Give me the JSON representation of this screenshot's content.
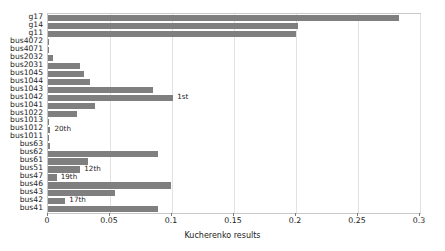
{
  "chart_data": {
    "type": "bar",
    "orientation": "horizontal",
    "title": "",
    "xlabel": "Kucherenko results",
    "ylabel": "",
    "xlim": [
      0,
      0.3
    ],
    "ylim": null,
    "grid": true,
    "legend": null,
    "tick_labels": [
      "0",
      "0.05",
      "0.1",
      "0.15",
      "0.2",
      "0.25",
      "0.3"
    ],
    "ticks": [
      0,
      0.05,
      0.1,
      0.15,
      0.2,
      0.25,
      0.3
    ],
    "bar_color": "#7f7f7f",
    "categories": [
      "g17",
      "g14",
      "g11",
      "bus4072",
      "bus4071",
      "bus2032",
      "bus2031",
      "bus1045",
      "bus1044",
      "bus1043",
      "bus1042",
      "bus1041",
      "bus1022",
      "bus1013",
      "bus1012",
      "bus1011",
      "bus63",
      "bus62",
      "bus61",
      "bus51",
      "bus47",
      "bus46",
      "bus43",
      "bus42",
      "bus41"
    ],
    "values": [
      0.283,
      0.202,
      0.2,
      0.001,
      0.001,
      0.004,
      0.026,
      0.029,
      0.034,
      0.085,
      0.101,
      0.038,
      0.023,
      0.001,
      0.002,
      0.001,
      0.002,
      0.089,
      0.032,
      0.026,
      0.007,
      0.099,
      0.054,
      0.014,
      0.089
    ],
    "annotations": [
      {
        "category": "bus1042",
        "label": "1st"
      },
      {
        "category": "bus1012",
        "label": "20th"
      },
      {
        "category": "bus51",
        "label": "12th"
      },
      {
        "category": "bus47",
        "label": "19th"
      },
      {
        "category": "bus42",
        "label": "17th"
      }
    ]
  }
}
